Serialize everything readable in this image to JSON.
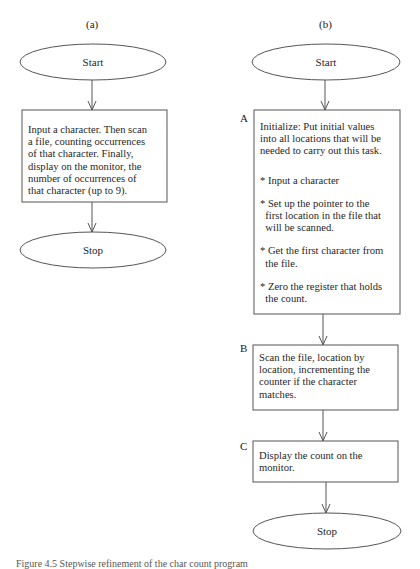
{
  "panels": {
    "a": {
      "label": "(a)",
      "start": "Start",
      "task_lines": [
        "Input a character. Then scan",
        "a file, counting occurrences",
        "of that character.  Finally,",
        "display on the monitor, the",
        "number of occurrences of",
        "that character (up to 9)."
      ],
      "stop": "Stop"
    },
    "b": {
      "label": "(b)",
      "start": "Start",
      "box_a": {
        "label": "A",
        "lines": [
          "Initialize: Put initial values",
          "into all locations that will be",
          "needed to carry out this task."
        ],
        "bullets": [
          [
            "* Input a character"
          ],
          [
            "* Set up the pointer to the",
            "  first location in the file that",
            "  will be scanned."
          ],
          [
            "* Get the first character from",
            "  the file."
          ],
          [
            "* Zero the register that holds",
            "  the count."
          ]
        ]
      },
      "box_b": {
        "label": "B",
        "lines": [
          "Scan the file, location by",
          "location, incrementing the",
          "counter if the character",
          "matches."
        ]
      },
      "box_c": {
        "label": "C",
        "lines": [
          "Display the count on the",
          "monitor."
        ]
      },
      "stop": "Stop"
    }
  },
  "caption": "Figure 4.5   Stepwise refinement of the char count program"
}
